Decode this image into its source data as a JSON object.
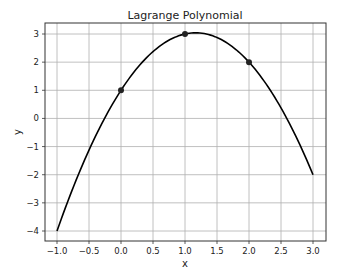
{
  "chart_data": {
    "type": "line",
    "title": "Lagrange Polynomial",
    "xlabel": "x",
    "ylabel": "y",
    "xlim": [
      -1.2,
      3.2
    ],
    "ylim": [
      -4.35,
      3.4
    ],
    "grid": true,
    "xticks": [
      -1.0,
      -0.5,
      0.0,
      0.5,
      1.0,
      1.5,
      2.0,
      2.5,
      3.0
    ],
    "xtick_labels": [
      "−1.0",
      "−0.5",
      "0.0",
      "0.5",
      "1.0",
      "1.5",
      "2.0",
      "2.5",
      "3.0"
    ],
    "yticks": [
      -4,
      -3,
      -2,
      -1,
      0,
      1,
      2,
      3
    ],
    "ytick_labels": [
      "−4",
      "−3",
      "−2",
      "−1",
      "0",
      "1",
      "2",
      "3"
    ],
    "series": [
      {
        "name": "Lagrange polynomial",
        "kind": "line",
        "color": "#000000",
        "coefficients": {
          "a": -1.5,
          "b": 3.5,
          "c": 1
        },
        "x_range": [
          -1.0,
          3.0
        ]
      },
      {
        "name": "data points",
        "kind": "scatter",
        "color": "#222222",
        "x": [
          0,
          1,
          2
        ],
        "y": [
          1,
          3,
          2
        ]
      }
    ]
  }
}
